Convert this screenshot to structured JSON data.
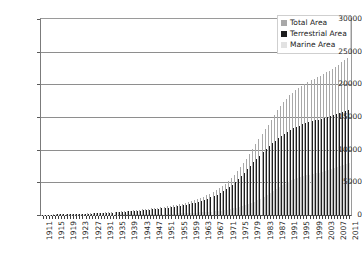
{
  "chart_data": {
    "type": "bar",
    "title": "",
    "xlabel": "",
    "ylabel": "",
    "ylim": [
      0,
      30000
    ],
    "ytick_values": [
      0,
      5000,
      10000,
      15000,
      20000,
      25000,
      30000
    ],
    "ytick_labels": [
      "0",
      "5000",
      "10000",
      "15000",
      "20000",
      "25000",
      "30000"
    ],
    "grid": true,
    "legend_position": "top-right-inside",
    "categories": [
      "1911",
      "1912",
      "1913",
      "1914",
      "1915",
      "1916",
      "1917",
      "1918",
      "1919",
      "1920",
      "1921",
      "1922",
      "1923",
      "1924",
      "1925",
      "1926",
      "1927",
      "1928",
      "1929",
      "1930",
      "1931",
      "1932",
      "1933",
      "1934",
      "1935",
      "1936",
      "1937",
      "1938",
      "1939",
      "1940",
      "1941",
      "1942",
      "1943",
      "1944",
      "1945",
      "1946",
      "1947",
      "1948",
      "1949",
      "1950",
      "1951",
      "1952",
      "1953",
      "1954",
      "1955",
      "1956",
      "1957",
      "1958",
      "1959",
      "1960",
      "1961",
      "1962",
      "1963",
      "1964",
      "1965",
      "1966",
      "1967",
      "1968",
      "1969",
      "1970",
      "1971",
      "1972",
      "1973",
      "1974",
      "1975",
      "1976",
      "1977",
      "1978",
      "1979",
      "1980",
      "1981",
      "1982",
      "1983",
      "1984",
      "1985",
      "1986",
      "1987",
      "1988",
      "1989",
      "1990",
      "1991",
      "1992",
      "1993",
      "1994",
      "1995",
      "1996",
      "1997",
      "1998",
      "1999",
      "2000",
      "2001",
      "2002",
      "2003",
      "2004",
      "2005",
      "2006",
      "2007",
      "2008",
      "2009",
      "2010",
      "2011"
    ],
    "xtick_labels": [
      "1911",
      "1915",
      "1919",
      "1923",
      "1927",
      "1931",
      "1935",
      "1939",
      "1943",
      "1947",
      "1951",
      "1955",
      "1959",
      "1963",
      "1967",
      "1971",
      "1975",
      "1979",
      "1983",
      "1987",
      "1991",
      "1995",
      "1999",
      "2003",
      "2007",
      "2011"
    ],
    "xtick_every": 4,
    "xtick_rotation": -90,
    "series": [
      {
        "name": "Total Area",
        "color": "#a8a8a8",
        "values": [
          40,
          50,
          60,
          70,
          80,
          90,
          100,
          110,
          125,
          140,
          155,
          170,
          185,
          200,
          220,
          240,
          260,
          285,
          310,
          335,
          360,
          390,
          420,
          450,
          485,
          520,
          555,
          595,
          635,
          675,
          715,
          760,
          805,
          850,
          900,
          950,
          1005,
          1060,
          1120,
          1180,
          1250,
          1320,
          1400,
          1480,
          1570,
          1660,
          1760,
          1870,
          1990,
          2120,
          2270,
          2430,
          2600,
          2790,
          3000,
          3230,
          3480,
          3760,
          4060,
          4400,
          4780,
          5200,
          5660,
          6170,
          6720,
          7320,
          7960,
          8640,
          9360,
          10100,
          10850,
          11600,
          12350,
          13100,
          13850,
          14600,
          15300,
          16000,
          16650,
          17250,
          17800,
          18300,
          18750,
          19150,
          19500,
          19820,
          20100,
          20350,
          20600,
          20850,
          21100,
          21350,
          21600,
          21850,
          22100,
          22380,
          22680,
          23000,
          23350,
          23700,
          24000
        ]
      },
      {
        "name": "Terrestrial Area",
        "color": "#1d1d1d",
        "values": [
          35,
          45,
          55,
          62,
          70,
          80,
          88,
          96,
          108,
          120,
          133,
          146,
          158,
          172,
          188,
          205,
          222,
          243,
          264,
          285,
          306,
          332,
          357,
          382,
          412,
          441,
          471,
          505,
          539,
          573,
          607,
          645,
          683,
          721,
          763,
          805,
          852,
          898,
          949,
          1000,
          1058,
          1117,
          1184,
          1251,
          1326,
          1401,
          1484,
          1576,
          1675,
          1783,
          1906,
          2038,
          2178,
          2333,
          2505,
          2692,
          2896,
          3124,
          3370,
          3645,
          3955,
          4290,
          4660,
          5065,
          5500,
          5970,
          6460,
          6980,
          7510,
          8050,
          8580,
          9100,
          9600,
          10080,
          10540,
          10980,
          11380,
          11760,
          12110,
          12430,
          12730,
          13000,
          13250,
          13480,
          13690,
          13880,
          14050,
          14200,
          14340,
          14470,
          14600,
          14730,
          14860,
          14990,
          15120,
          15260,
          15400,
          15550,
          15720,
          15880,
          16000
        ]
      },
      {
        "name": "Marine Area",
        "color": "#e2e2e2",
        "values": [
          5,
          5,
          6,
          8,
          10,
          10,
          12,
          14,
          17,
          20,
          22,
          24,
          27,
          28,
          32,
          35,
          38,
          42,
          46,
          50,
          54,
          58,
          63,
          68,
          73,
          79,
          84,
          90,
          96,
          102,
          108,
          115,
          122,
          129,
          137,
          145,
          153,
          162,
          171,
          180,
          192,
          203,
          216,
          229,
          244,
          259,
          276,
          294,
          315,
          337,
          364,
          392,
          422,
          457,
          495,
          538,
          584,
          636,
          690,
          755,
          825,
          910,
          1000,
          1105,
          1220,
          1350,
          1500,
          1660,
          1850,
          2050,
          2270,
          2500,
          2750,
          3020,
          3310,
          3620,
          3920,
          4240,
          4540,
          4820,
          5070,
          5300,
          5500,
          5670,
          5810,
          5940,
          6050,
          6150,
          6260,
          6380,
          6500,
          6620,
          6740,
          6860,
          6980,
          7120,
          7280,
          7450,
          7630,
          7820,
          8000
        ]
      }
    ]
  }
}
